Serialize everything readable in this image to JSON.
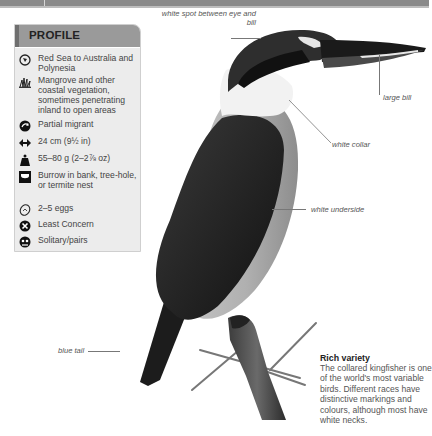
{
  "profile": {
    "title": "PROFILE",
    "items": [
      {
        "icon": "globe-icon",
        "text": "Red Sea to Australia and Polynesia"
      },
      {
        "icon": "habitat-grass-icon",
        "text": "Mangrove and other coastal vegetation, sometimes penetrating inland to open areas"
      },
      {
        "icon": "migration-arrow-icon",
        "text": "Partial migrant"
      },
      {
        "icon": "length-arrows-icon",
        "text": "24 cm (9½ in)"
      },
      {
        "icon": "weight-icon",
        "text": "55–80 g (2–2⅞ oz)"
      },
      {
        "icon": "nest-icon",
        "text": "Burrow in bank, tree-hole, or termite nest"
      },
      {
        "icon": "egg-icon",
        "text": "2–5 eggs"
      },
      {
        "icon": "status-cross-icon",
        "text": "Least Concern"
      },
      {
        "icon": "social-icon",
        "text": "Solitary/pairs"
      }
    ]
  },
  "annotations": {
    "white_spot": "white spot between eye and bill",
    "large_bill": "large bill",
    "white_collar": "white collar",
    "white_underside": "white underside",
    "blue_tail": "blue tail"
  },
  "note": {
    "title": "Rich variety",
    "body": "The collared kingfisher is one of the world's most variable birds. Different races have distinctive markings and colours, although most have white necks."
  },
  "colors": {
    "header_bar": "#8a8a8a",
    "profile_bg": "#ececec",
    "profile_head": "#9a9a9a",
    "text_dark": "#222222",
    "text_body": "#555555"
  }
}
